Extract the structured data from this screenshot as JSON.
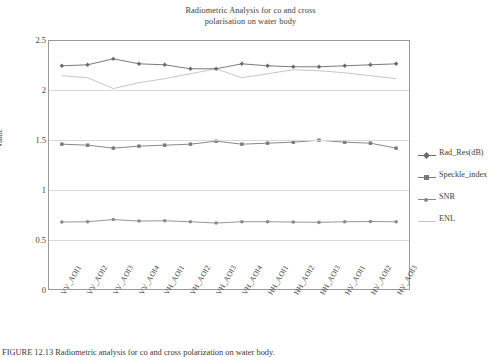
{
  "chart_data": {
    "type": "line",
    "title": "Radiometric Analysis for co and cross polarisation on water body",
    "title_line1": "Radiometric Analysis for co and cross",
    "title_line2": "polarisation on water body",
    "xlabel": "",
    "ylabel": "Value",
    "ylim": [
      0,
      2.5
    ],
    "yticks": [
      "0",
      "0.5",
      "1",
      "1.5",
      "2",
      "2.5"
    ],
    "ytick_values": [
      0,
      0.5,
      1,
      1.5,
      2,
      2.5
    ],
    "grid": true,
    "grid_axis": "y",
    "legend_position": "right",
    "categories": [
      "VV_AOI1",
      "VV_AOI2",
      "VV_AOI3",
      "VV_AOI4",
      "VH_AOI1",
      "VH_AOI2",
      "VH_AOI3",
      "VH_AOI4",
      "HH_AOI1",
      "HH_AOI2",
      "HH_AOI3",
      "HV_AOI1",
      "HV_AOI2",
      "HV_AOI3"
    ],
    "series": [
      {
        "name": "Rad_Res(dB)",
        "color": "#6b6b6b",
        "marker": "diamond",
        "values": [
          2.25,
          2.26,
          2.32,
          2.27,
          2.26,
          2.22,
          2.22,
          2.27,
          2.25,
          2.24,
          2.24,
          2.25,
          2.26,
          2.27
        ]
      },
      {
        "name": "Speckle_index",
        "color": "#7a7a7a",
        "marker": "square",
        "values": [
          1.46,
          1.45,
          1.42,
          1.44,
          1.45,
          1.46,
          1.49,
          1.46,
          1.47,
          1.48,
          1.5,
          1.48,
          1.47,
          1.42
        ]
      },
      {
        "name": "SNR",
        "color": "#8a8a8a",
        "marker": "circle",
        "values": [
          0.675,
          0.678,
          0.7,
          0.685,
          0.688,
          0.678,
          0.665,
          0.678,
          0.678,
          0.675,
          0.672,
          0.678,
          0.68,
          0.678
        ]
      },
      {
        "name": "ENL",
        "color": "#c0c0c0",
        "marker": "none",
        "values": [
          2.15,
          2.13,
          2.02,
          2.08,
          2.12,
          2.17,
          2.22,
          2.13,
          2.17,
          2.21,
          2.2,
          2.18,
          2.15,
          2.12
        ]
      }
    ]
  },
  "legend": {
    "items": [
      {
        "label": "Rad_Res(dB)"
      },
      {
        "label": "Speckle_index"
      },
      {
        "label": "SNR"
      },
      {
        "label": "ENL"
      }
    ]
  },
  "caption": {
    "text": "FIGURE 12.13   Radiometric analysis for co and cross polarization on water body."
  }
}
